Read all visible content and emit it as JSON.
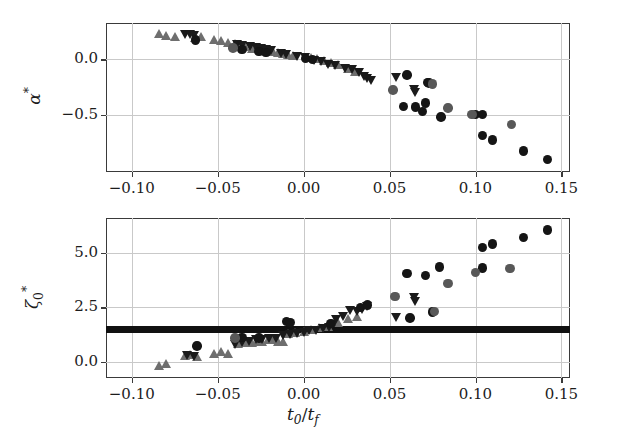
{
  "figure": {
    "background": "#ffffff",
    "axis_color": "#3a3a3a",
    "grid_color": "#c9c9c9",
    "xlabel": "t0/tf",
    "xlabel_parts": {
      "t": "t",
      "zero": "0",
      "slash": "/",
      "t2": "t",
      "f": "f"
    }
  },
  "marker_colors": {
    "light_gray": "#6e6e6e",
    "mid_gray": "#565656",
    "dark": "#1a1a1a",
    "black": "#111111"
  },
  "chart_data": [
    {
      "type": "scatter",
      "id": "panel-alpha",
      "title": "",
      "xlabel": "t0/tf",
      "ylabel": "alpha*",
      "ylabel_display": "α*",
      "xlim": [
        -0.115,
        0.155
      ],
      "ylim": [
        -1.02,
        0.33
      ],
      "xticks": [
        -0.1,
        -0.05,
        0.0,
        0.05,
        0.1,
        0.15
      ],
      "xticklabels": [
        "−0.10",
        "−0.05",
        "0.00",
        "0.05",
        "0.10",
        "0.15"
      ],
      "yticks": [
        0.0,
        -0.5
      ],
      "yticklabels": [
        "0.0",
        "−0.5"
      ],
      "grid": true,
      "legend": "none",
      "series": [
        {
          "name": "up-triangle-light",
          "marker": "triangle-up",
          "color": "#6e6e6e",
          "points": [
            [
              -0.084,
              0.235
            ],
            [
              -0.08,
              0.215
            ],
            [
              -0.075,
              0.205
            ],
            [
              -0.063,
              0.195
            ],
            [
              -0.06,
              0.205
            ],
            [
              -0.052,
              0.185
            ],
            [
              -0.048,
              0.17
            ],
            [
              -0.044,
              0.15
            ],
            [
              -0.04,
              0.145
            ],
            [
              -0.034,
              0.12
            ],
            [
              -0.03,
              0.1
            ],
            [
              -0.027,
              0.095
            ],
            [
              -0.024,
              0.085
            ],
            [
              -0.021,
              0.075
            ],
            [
              -0.018,
              0.07
            ],
            [
              -0.015,
              0.062
            ],
            [
              -0.012,
              0.055
            ],
            [
              -0.009,
              0.045
            ],
            [
              -0.006,
              0.038
            ],
            [
              0.004,
              0.018
            ],
            [
              0.008,
              0.005
            ],
            [
              0.012,
              -0.01
            ],
            [
              0.016,
              -0.03
            ],
            [
              0.02,
              -0.05
            ],
            [
              0.026,
              -0.085
            ],
            [
              0.03,
              -0.105
            ]
          ]
        },
        {
          "name": "down-triangle-dark",
          "marker": "triangle-down",
          "color": "#1a1a1a",
          "points": [
            [
              -0.069,
              0.23
            ],
            [
              -0.066,
              0.225
            ],
            [
              -0.064,
              0.218
            ],
            [
              -0.039,
              0.14
            ],
            [
              -0.036,
              0.13
            ],
            [
              -0.031,
              0.118
            ],
            [
              -0.028,
              0.11
            ],
            [
              -0.025,
              0.1
            ],
            [
              -0.022,
              0.09
            ],
            [
              -0.019,
              0.082
            ],
            [
              -0.013,
              0.058
            ],
            [
              -0.01,
              0.048
            ],
            [
              -0.004,
              0.03
            ],
            [
              0.001,
              0.015
            ],
            [
              0.006,
              -0.005
            ],
            [
              0.01,
              -0.022
            ],
            [
              0.014,
              -0.042
            ],
            [
              0.018,
              -0.058
            ],
            [
              0.024,
              -0.08
            ],
            [
              0.028,
              -0.095
            ],
            [
              0.032,
              -0.12
            ],
            [
              0.035,
              -0.15
            ],
            [
              0.037,
              -0.175
            ],
            [
              0.039,
              -0.19
            ],
            [
              0.054,
              -0.16
            ],
            [
              0.064,
              -0.275
            ],
            [
              0.065,
              -0.3
            ]
          ]
        },
        {
          "name": "circle-dark",
          "marker": "circle",
          "color": "#151515",
          "points": [
            [
              -0.063,
              0.175
            ],
            [
              -0.036,
              0.09
            ],
            [
              -0.026,
              0.07
            ],
            [
              -0.022,
              0.065
            ],
            [
              0.001,
              0.01
            ],
            [
              0.005,
              -0.002
            ],
            [
              0.06,
              -0.14
            ],
            [
              0.072,
              -0.21
            ],
            [
              0.073,
              -0.215
            ],
            [
              0.058,
              -0.425
            ],
            [
              0.065,
              -0.43
            ],
            [
              0.071,
              -0.395
            ],
            [
              0.069,
              -0.47
            ],
            [
              0.08,
              -0.52
            ],
            [
              0.1,
              -0.5
            ],
            [
              0.104,
              -0.5
            ],
            [
              0.104,
              -0.69
            ],
            [
              0.11,
              -0.73
            ],
            [
              0.128,
              -0.83
            ],
            [
              0.142,
              -0.905
            ]
          ]
        },
        {
          "name": "circle-gray",
          "marker": "circle",
          "color": "#585858",
          "points": [
            [
              -0.041,
              0.105
            ],
            [
              0.052,
              -0.275
            ],
            [
              0.075,
              -0.22
            ],
            [
              0.084,
              -0.44
            ],
            [
              0.098,
              -0.5
            ],
            [
              0.121,
              -0.59
            ]
          ]
        }
      ]
    },
    {
      "type": "scatter",
      "id": "panel-zeta",
      "title": "",
      "xlabel": "t0/tf",
      "ylabel": "zeta_0*",
      "ylabel_display": "ζ₀*",
      "xlim": [
        -0.115,
        0.155
      ],
      "ylim": [
        -0.75,
        6.6
      ],
      "xticks": [
        -0.1,
        -0.05,
        0.0,
        0.05,
        0.1,
        0.15
      ],
      "xticklabels": [
        "−0.10",
        "−0.05",
        "0.00",
        "0.05",
        "0.10",
        "0.15"
      ],
      "yticks": [
        0.0,
        2.5,
        5.0
      ],
      "yticklabels": [
        "0.0",
        "2.5",
        "5.0"
      ],
      "grid": true,
      "legend": "none",
      "hline": {
        "value": 1.5,
        "color": "#111111",
        "thickness_px": 7,
        "label": "reference band"
      },
      "series": [
        {
          "name": "up-triangle-light",
          "marker": "triangle-up",
          "color": "#6e6e6e",
          "points": [
            [
              -0.084,
              -0.18
            ],
            [
              -0.08,
              -0.1
            ],
            [
              -0.069,
              0.3
            ],
            [
              -0.066,
              0.32
            ],
            [
              -0.062,
              0.22
            ],
            [
              -0.052,
              0.4
            ],
            [
              -0.048,
              0.45
            ],
            [
              -0.044,
              0.38
            ],
            [
              -0.038,
              0.85
            ],
            [
              -0.034,
              0.88
            ],
            [
              -0.03,
              0.9
            ],
            [
              -0.027,
              0.92
            ],
            [
              -0.024,
              0.95
            ],
            [
              -0.021,
              1.0
            ],
            [
              -0.018,
              1.02
            ],
            [
              -0.015,
              0.95
            ],
            [
              -0.012,
              0.92
            ],
            [
              -0.009,
              1.3
            ],
            [
              -0.005,
              1.35
            ],
            [
              0.0,
              1.4
            ],
            [
              0.004,
              1.5
            ],
            [
              0.009,
              1.58
            ],
            [
              0.014,
              1.62
            ],
            [
              0.02,
              1.82
            ],
            [
              0.026,
              2.0
            ],
            [
              0.031,
              2.1
            ]
          ]
        },
        {
          "name": "down-triangle-dark",
          "marker": "triangle-down",
          "color": "#1a1a1a",
          "points": [
            [
              -0.068,
              0.28
            ],
            [
              -0.064,
              0.24
            ],
            [
              -0.04,
              0.8
            ],
            [
              -0.036,
              0.9
            ],
            [
              -0.032,
              0.95
            ],
            [
              -0.028,
              1.0
            ],
            [
              -0.024,
              1.02
            ],
            [
              -0.02,
              1.05
            ],
            [
              -0.016,
              1.08
            ],
            [
              -0.012,
              1.2
            ],
            [
              -0.008,
              1.25
            ],
            [
              -0.004,
              1.3
            ],
            [
              0.0,
              1.35
            ],
            [
              0.003,
              1.42
            ],
            [
              0.007,
              1.45
            ],
            [
              0.011,
              1.52
            ],
            [
              0.015,
              1.55
            ],
            [
              0.019,
              1.95
            ],
            [
              0.023,
              2.1
            ],
            [
              0.027,
              2.35
            ],
            [
              0.031,
              2.3
            ],
            [
              0.034,
              2.4
            ],
            [
              0.037,
              2.55
            ],
            [
              0.054,
              2.05
            ],
            [
              0.064,
              2.95
            ],
            [
              0.065,
              2.75
            ]
          ]
        },
        {
          "name": "circle-dark",
          "marker": "circle",
          "color": "#151515",
          "points": [
            [
              -0.062,
              0.72
            ],
            [
              -0.036,
              1.12
            ],
            [
              -0.026,
              1.1
            ],
            [
              -0.01,
              1.85
            ],
            [
              -0.008,
              1.8
            ],
            [
              0.016,
              1.75
            ],
            [
              0.033,
              2.5
            ],
            [
              0.037,
              2.6
            ],
            [
              0.06,
              4.05
            ],
            [
              0.062,
              2.02
            ],
            [
              0.071,
              3.95
            ],
            [
              0.075,
              2.28
            ],
            [
              0.079,
              4.35
            ],
            [
              0.104,
              5.25
            ],
            [
              0.104,
              4.3
            ],
            [
              0.11,
              5.4
            ],
            [
              0.128,
              5.7
            ],
            [
              0.142,
              6.05
            ]
          ]
        },
        {
          "name": "circle-gray",
          "marker": "circle",
          "color": "#585858",
          "points": [
            [
              -0.04,
              1.08
            ],
            [
              0.053,
              3.0
            ],
            [
              0.076,
              2.3
            ],
            [
              0.084,
              3.6
            ],
            [
              0.1,
              4.1
            ],
            [
              0.12,
              4.28
            ]
          ]
        }
      ]
    }
  ]
}
